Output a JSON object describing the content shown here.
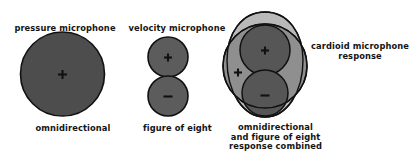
{
  "figure": {
    "title_semantic": "microphone-polar-response-diagram",
    "background_color": "#ffffff",
    "panels": [
      {
        "id": "pressure",
        "top_label": "pressure microphone",
        "bottom_label": "omnidirectional",
        "shape": "filled-circle",
        "fill_color": "#4d4d4d",
        "outline_color": "#111111",
        "polarity_signs": [
          "+"
        ]
      },
      {
        "id": "velocity",
        "top_label": "velocity microphone",
        "bottom_label": "figure of eight",
        "shape": "two-stacked-circles",
        "fill_color": "#5c5c5c",
        "outline_color": "#111111",
        "polarity_signs": [
          "+",
          "-"
        ]
      },
      {
        "id": "combined",
        "top_label": "",
        "bottom_label": "omnidirectional\nand figure of eight\nresponse combined",
        "side_label": "cardioid microphone\nresponse",
        "shape": "cardioid-overlay",
        "cardioid_fill": "#b9b9b9",
        "omni_fill": "#8f8f8f",
        "lobe_fill": "#565656",
        "overlap_fill": "#3f3f3f",
        "outline_color": "#111111",
        "polarity_signs": [
          "+",
          "+",
          "-"
        ]
      }
    ],
    "colors": {
      "dark_fill": "#4d4d4d",
      "mid_fill": "#8f8f8f",
      "light_fill": "#b9b9b9",
      "lobe_fill": "#565656",
      "overlap_fill": "#3f3f3f",
      "stroke": "#111111",
      "text": "#141414"
    }
  }
}
